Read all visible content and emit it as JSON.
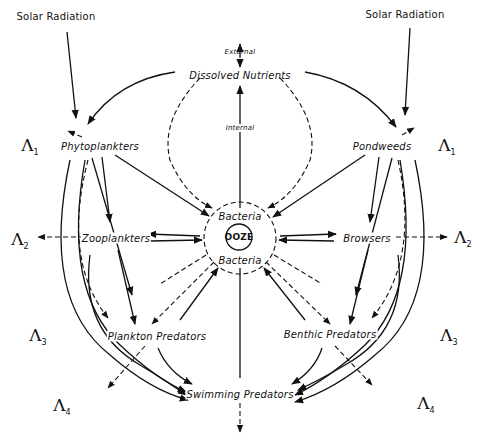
{
  "diagram": {
    "title": "",
    "nodes": {
      "solar_left": "Solar Radiation",
      "solar_right": "Solar Radiation",
      "external": "External",
      "dissolved_nutrients": "Dissolved Nutrients",
      "internal": "Internal",
      "phytoplankters": "Phytoplankters",
      "pondweeds": "Pondweeds",
      "zooplankters": "Zooplankters",
      "browsers": "Browsers",
      "bacteria_top": "Bacteria",
      "ooze": "OOZE",
      "bacteria_bottom": "Bacteria",
      "plankton_predators": "Plankton Predators",
      "benthic_predators": "Benthic Predators",
      "swimming_predators": "Swimming Predators"
    },
    "levels": {
      "l1_left": {
        "symbol": "Λ",
        "sub": "1"
      },
      "l1_right": {
        "symbol": "Λ",
        "sub": "1"
      },
      "l2_left": {
        "symbol": "Λ",
        "sub": "2"
      },
      "l2_right": {
        "symbol": "Λ",
        "sub": "2"
      },
      "l3_left": {
        "symbol": "Λ",
        "sub": "3"
      },
      "l3_right": {
        "symbol": "Λ",
        "sub": "3"
      },
      "l4_left": {
        "symbol": "Λ",
        "sub": "4"
      },
      "l4_right": {
        "symbol": "Λ",
        "sub": "4"
      }
    },
    "colors": {
      "ink": "#111111",
      "background": "#ffffff"
    }
  }
}
